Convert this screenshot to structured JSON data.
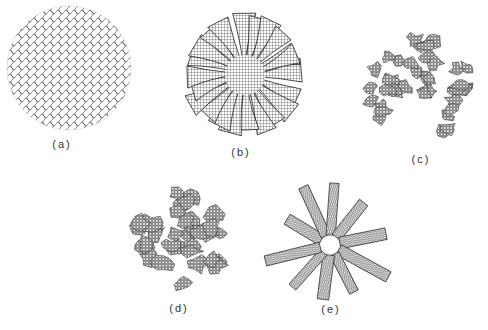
{
  "figure": {
    "panels": [
      {
        "id": "a",
        "label": "(a)",
        "description": "random coil tangle (amorphous)",
        "cx": 69,
        "cy": 68,
        "r": 62,
        "label_x": 62,
        "label_y": 138
      },
      {
        "id": "b",
        "label": "(b)",
        "description": "radiating crosshatched lamellar arms (spherulite)",
        "cx": 245,
        "cy": 75,
        "r": 64,
        "label_x": 241,
        "label_y": 146
      },
      {
        "id": "c",
        "label": "(c)",
        "description": "dispersed granular clusters",
        "cx": 420,
        "cy": 90,
        "r": 60,
        "label_x": 421,
        "label_y": 153
      },
      {
        "id": "d",
        "label": "(d)",
        "description": "interconnected granular clusters",
        "cx": 180,
        "cy": 237,
        "r": 58,
        "label_x": 179,
        "label_y": 302
      },
      {
        "id": "e",
        "label": "(e)",
        "description": "folded-chain lamellar ribbons radiating",
        "cx": 330,
        "cy": 245,
        "r": 60,
        "label_x": 331,
        "label_y": 303
      }
    ],
    "colors": {
      "ink": "#222222",
      "background": "#ffffff"
    }
  }
}
